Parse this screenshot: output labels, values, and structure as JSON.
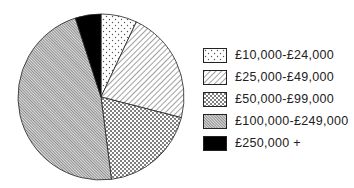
{
  "chart_data": {
    "type": "pie",
    "title": "",
    "start_angle_deg": 0,
    "direction": "clockwise",
    "categories": [
      "£10,000-£24,000",
      "£25,000-£49,000",
      "£50,000-£99,000",
      "£100,000-£249,000",
      "£250,000 +"
    ],
    "values": [
      7,
      22,
      19,
      47,
      5
    ],
    "unit": "percent (estimated)",
    "patterns": [
      "sparse-dots",
      "diagonal-lines",
      "dense-dots",
      "fine-diagonal-hatch",
      "solid-black"
    ],
    "legend_position": "right"
  },
  "legend": {
    "items": [
      {
        "label": "£10,000-£24,000",
        "pattern": "sparse-dots"
      },
      {
        "label": "£25,000-£49,000",
        "pattern": "diagonal-lines"
      },
      {
        "label": "£50,000-£99,000",
        "pattern": "dense-dots"
      },
      {
        "label": "£100,000-£249,000",
        "pattern": "fine-diagonal-hatch"
      },
      {
        "label": "£250,000 +",
        "pattern": "solid-black"
      }
    ]
  }
}
